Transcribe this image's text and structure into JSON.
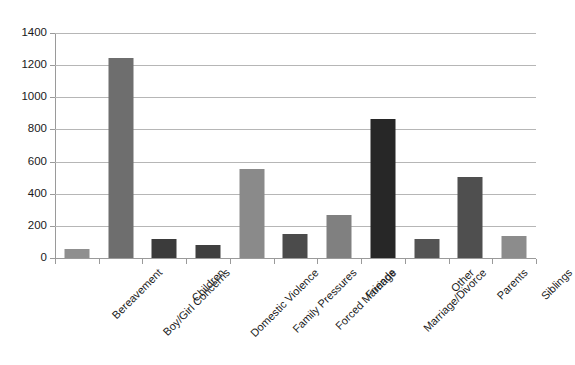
{
  "chart_data": {
    "type": "bar",
    "title": "",
    "subtitle": "",
    "xlabel": "",
    "ylabel": "",
    "ylim": [
      0,
      1400
    ],
    "yticks": [
      0,
      200,
      400,
      600,
      800,
      1000,
      1200,
      1400
    ],
    "ytick_labels": [
      "0",
      "200",
      "400",
      "600",
      "800",
      "1000",
      "1200",
      "1400"
    ],
    "grid": "horizontal",
    "legend": "none",
    "categories": [
      "Bereavement",
      "Boy/Girl Concerns",
      "Children",
      "Domestic Violence",
      "Family Pressures",
      "Forced Marriage",
      "Friends",
      "Marriage/Divorce",
      "Other",
      "Parents",
      "Siblings"
    ],
    "values": [
      55,
      1245,
      120,
      82,
      552,
      150,
      265,
      865,
      118,
      505,
      138
    ],
    "bar_colors": [
      "#8f8f8f",
      "#6e6e6e",
      "#3b3b3b",
      "#3f3f3f",
      "#8a8a8a",
      "#4b4b4b",
      "#808080",
      "#272727",
      "#545454",
      "#4f4f4f",
      "#8c8c8c"
    ]
  },
  "style": {
    "background_color": "#ffffff",
    "gridline_color": "#b6b6b6",
    "axis_color": "#9a9a9a",
    "text_color": "#1a1a1a"
  }
}
